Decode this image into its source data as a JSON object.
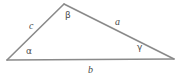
{
  "figure": {
    "type": "geometry-diagram",
    "background_color": "#ffffff",
    "stroke_color": "#8a8a8a",
    "label_color": "#4a4a4a",
    "stroke_width": 1.6
  },
  "vertices": [
    {
      "name": "left-vertex",
      "x": 7,
      "y": 60
    },
    {
      "name": "apex-vertex",
      "x": 64,
      "y": 4
    },
    {
      "name": "right-vertex",
      "x": 174,
      "y": 59
    }
  ],
  "sides": {
    "left": {
      "label": "c",
      "from": "left-vertex",
      "to": "apex-vertex"
    },
    "right": {
      "label": "a",
      "from": "apex-vertex",
      "to": "right-vertex"
    },
    "bottom": {
      "label": "b",
      "from": "left-vertex",
      "to": "right-vertex"
    }
  },
  "angles": {
    "at_left": {
      "label": "α",
      "name": "alpha"
    },
    "at_apex": {
      "label": "β",
      "name": "beta"
    },
    "at_right": {
      "label": "γ",
      "name": "gamma"
    }
  }
}
